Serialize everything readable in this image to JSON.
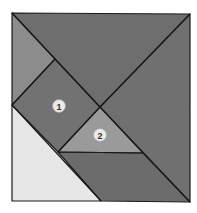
{
  "diagram": {
    "type": "tangram-square",
    "colors": {
      "dark": "#6f6f6f",
      "medium": "#8a8a8a",
      "triangle2": "#9a9a9a",
      "light": "#e6e6e6",
      "stroke": "#1a1a1a",
      "label_bg": "#e8e8e8"
    },
    "pieces": [
      {
        "id": "top-large-triangle",
        "points": "12,13 190,14 100,107",
        "fill": "#6e6e6e"
      },
      {
        "id": "right-large-triangle",
        "points": "190,14 190,202 100,107",
        "fill": "#707070"
      },
      {
        "id": "left-parallelogram",
        "points": "12,13 55,59 12,105",
        "fill": "#8c8c8c"
      },
      {
        "id": "square-1",
        "points": "55,59 100,107 58,152 12,105",
        "fill": "#727272"
      },
      {
        "id": "triangle-2",
        "points": "100,107 143,153 58,152",
        "fill": "#9a9a9a"
      },
      {
        "id": "bottom-parallelogram",
        "points": "58,152 143,153 190,202 101,201",
        "fill": "#6c6c6c"
      },
      {
        "id": "light-triangle",
        "points": "12,105 101,201 12,201",
        "fill": "#e6e6e6"
      }
    ],
    "labels": [
      {
        "text": "1",
        "cx": 59,
        "cy": 106
      },
      {
        "text": "2",
        "cx": 100,
        "cy": 135
      }
    ]
  }
}
